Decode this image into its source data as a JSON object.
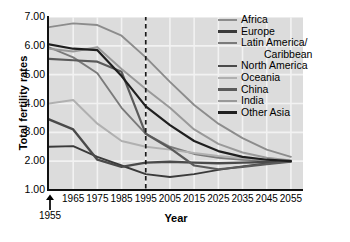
{
  "chart_data": {
    "type": "line",
    "title": "",
    "xlabel": "Year",
    "ylabel": "Total fertility rates",
    "xlim": [
      1955,
      2060
    ],
    "ylim": [
      1.0,
      7.0
    ],
    "grid": true,
    "legend_position": "right",
    "x_tick_labels": [
      "1965",
      "1975",
      "1985",
      "1995",
      "2005",
      "2015",
      "2025",
      "2035",
      "2045",
      "2055"
    ],
    "x_tick_values": [
      1965,
      1975,
      1985,
      1995,
      2005,
      2015,
      2025,
      2035,
      2045,
      2055
    ],
    "y_tick_labels": [
      "1.00",
      "2.00",
      "3.00",
      "4.00",
      "5.00",
      "6.00",
      "7.00"
    ],
    "y_tick_values": [
      1.0,
      2.0,
      3.0,
      4.0,
      5.0,
      6.0,
      7.0
    ],
    "annotations": [
      {
        "name": "start-year-arrow",
        "label": "1955",
        "x": 1955,
        "type": "arrow-up"
      },
      {
        "name": "projection-divider",
        "label": "",
        "x": 1995,
        "type": "dashed-vertical-line"
      }
    ],
    "x": [
      1955,
      1965,
      1975,
      1985,
      1995,
      2005,
      2015,
      2025,
      2035,
      2045,
      2055
    ],
    "series": [
      {
        "name": "Africa",
        "color": "#8c8c8c",
        "width": 1.9,
        "values": [
          6.65,
          6.78,
          6.72,
          6.35,
          5.6,
          4.75,
          3.95,
          3.3,
          2.8,
          2.4,
          2.15
        ]
      },
      {
        "name": "Europe",
        "color": "#3a3a3a",
        "width": 1.9,
        "values": [
          2.5,
          2.52,
          2.15,
          1.85,
          1.55,
          1.45,
          1.55,
          1.7,
          1.82,
          1.92,
          2.0
        ]
      },
      {
        "name": "Latin America/Caribbean",
        "color": "#7a7a7a",
        "width": 1.9,
        "values": [
          5.95,
          5.6,
          5.05,
          3.85,
          2.95,
          2.5,
          2.25,
          2.12,
          2.05,
          2.02,
          2.0
        ]
      },
      {
        "name": "North America",
        "color": "#4a4a4a",
        "width": 2.4,
        "values": [
          3.45,
          3.1,
          2.05,
          1.8,
          1.95,
          1.98,
          1.95,
          1.93,
          1.95,
          1.97,
          2.0
        ]
      },
      {
        "name": "Oceania",
        "color": "#b0b0b0",
        "width": 2.0,
        "values": [
          4.0,
          4.12,
          3.3,
          2.7,
          2.5,
          2.4,
          2.28,
          2.18,
          2.1,
          2.05,
          2.02
        ]
      },
      {
        "name": "China",
        "color": "#5a5a5a",
        "width": 2.2,
        "values": [
          5.55,
          5.5,
          5.45,
          5.1,
          2.95,
          2.45,
          1.85,
          1.72,
          1.8,
          1.9,
          1.98
        ]
      },
      {
        "name": "India",
        "color": "#999999",
        "width": 2.0,
        "values": [
          5.9,
          5.8,
          5.95,
          5.2,
          4.5,
          3.85,
          3.1,
          2.6,
          2.3,
          2.12,
          2.02
        ]
      },
      {
        "name": "Other Asia",
        "color": "#1f1f1f",
        "width": 2.2,
        "values": [
          6.05,
          5.9,
          5.85,
          4.95,
          3.9,
          3.25,
          2.7,
          2.35,
          2.15,
          2.05,
          2.0
        ]
      }
    ]
  },
  "legend": {
    "items": [
      {
        "label": "Africa",
        "color": "#8c8c8c",
        "continuation": ""
      },
      {
        "label": "Europe",
        "color": "#3a3a3a",
        "continuation": ""
      },
      {
        "label": "Latin America/",
        "color": "#7a7a7a",
        "continuation": "Caribbean"
      },
      {
        "label": "North America",
        "color": "#4a4a4a",
        "continuation": ""
      },
      {
        "label": "Oceania",
        "color": "#b0b0b0",
        "continuation": ""
      },
      {
        "label": "China",
        "color": "#5a5a5a",
        "continuation": ""
      },
      {
        "label": "India",
        "color": "#999999",
        "continuation": ""
      },
      {
        "label": "Other Asia",
        "color": "#1f1f1f",
        "continuation": ""
      }
    ]
  },
  "axes": {
    "x_title": "Year",
    "y_title": "Total fertility rates"
  },
  "colors": {
    "plot_background": "#dcdcdc",
    "grid": "#f2f2f2",
    "axis": "#111111",
    "page_background": "#ffffff",
    "divider": "#1a1a1a"
  }
}
